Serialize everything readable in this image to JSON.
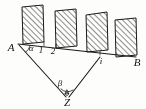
{
  "figure": {
    "kind": "geometry-diagram",
    "stroke_color": "#1a1a1a",
    "background_color": "#fdfdfc",
    "hatch_color": "#3a3a3a"
  },
  "points": {
    "A": {
      "label": "A",
      "x": 14,
      "y": 47
    },
    "B": {
      "label": "B",
      "x": 137,
      "y": 61
    },
    "Z": {
      "label": "Z",
      "x": 67,
      "y": 102
    },
    "i": {
      "label": "i",
      "x": 101,
      "y": 60
    }
  },
  "angles": {
    "alpha": {
      "label": "α",
      "x": 31,
      "y": 48,
      "at": "A"
    },
    "beta": {
      "label": "β",
      "x": 59,
      "y": 84,
      "at": "Z"
    }
  },
  "station_labels": [
    {
      "label": "1",
      "x": 40,
      "y": 51
    },
    {
      "label": "2",
      "x": 52,
      "y": 52
    },
    {
      "label": "i",
      "x": 101,
      "y": 62
    }
  ],
  "baseline": {
    "name": "A-B baseline",
    "x1": 18,
    "y1": 44,
    "x2": 135,
    "y2": 57
  },
  "sight_lines": [
    {
      "name": "A-to-Z",
      "x1": 19,
      "y1": 45,
      "x2": 65,
      "y2": 98
    },
    {
      "name": "i-to-Z",
      "x1": 100,
      "y1": 57,
      "x2": 68,
      "y2": 98
    }
  ],
  "bars": [
    {
      "name": "bar-1",
      "x": 21,
      "y": 6,
      "w": 22,
      "h": 37
    },
    {
      "name": "bar-2",
      "x": 54,
      "y": 9,
      "w": 22,
      "h": 38
    },
    {
      "name": "bar-3",
      "x": 86,
      "y": 13,
      "w": 22,
      "h": 38
    },
    {
      "name": "bar-4",
      "x": 115,
      "y": 18,
      "w": 22,
      "h": 37
    }
  ],
  "marker": {
    "name": "station-marker-Z",
    "glyph": "✩",
    "x": 67,
    "y": 95
  }
}
